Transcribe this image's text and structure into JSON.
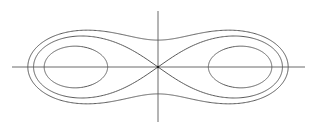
{
  "diagram": {
    "type": "level-curves",
    "colors": {
      "background": "#ffffff",
      "curve": "#5a5a5a",
      "axis": "#6a6a6a",
      "origin": "#222222"
    },
    "origin_px": [
      158,
      67
    ],
    "scale_px": {
      "x": 88,
      "y": 62
    },
    "axes": {
      "horizontal": {
        "x1": 12,
        "x2": 305,
        "y": 67
      },
      "vertical": {
        "x": 158,
        "y1": 11,
        "y2": 122
      }
    },
    "curves": [
      {
        "name": "outer-oval",
        "focus_a": 1,
        "b": 1.09,
        "kind": "single-peanut"
      },
      {
        "name": "lemniscate",
        "focus_a": 1,
        "b": 1.0,
        "kind": "figure-eight"
      },
      {
        "name": "inner-ovals",
        "focus_a": 1,
        "b": 0.82,
        "kind": "two-loops"
      }
    ]
  }
}
